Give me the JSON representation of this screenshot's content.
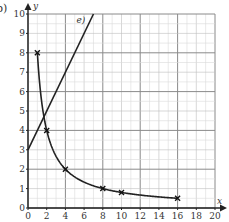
{
  "question_label": "b)",
  "chart_data": {
    "type": "line",
    "title": "",
    "xlabel": "x",
    "ylabel": "y",
    "xlim": [
      0,
      20
    ],
    "ylim": [
      0,
      10
    ],
    "x_ticks": [
      0,
      2,
      4,
      6,
      8,
      10,
      12,
      14,
      16,
      18,
      20
    ],
    "y_ticks": [
      0,
      1,
      2,
      3,
      4,
      5,
      6,
      7,
      8,
      9,
      10
    ],
    "grid": true,
    "grid_minor_x": 1,
    "grid_minor_y": 0.5,
    "grid_major_x": 4,
    "grid_major_y": 2,
    "series": [
      {
        "name": "curve",
        "kind": "smooth-curve-with-crosses",
        "equation": "y = 8/x",
        "x": [
          1,
          2,
          4,
          8,
          10,
          16
        ],
        "y": [
          8,
          4,
          2,
          1,
          0.8,
          0.5
        ],
        "color": "#222222"
      },
      {
        "name": "e)",
        "kind": "straight-line",
        "equation": "y = x + 3",
        "x": [
          0,
          7
        ],
        "y": [
          3,
          10
        ],
        "color": "#222222",
        "label": "e)"
      }
    ]
  }
}
